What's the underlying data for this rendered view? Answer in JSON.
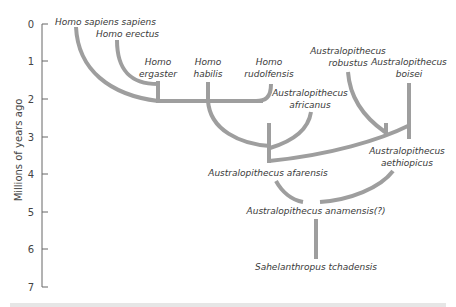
{
  "axis": {
    "title": "Millions of years ago",
    "ticks": [
      "0",
      "1",
      "2",
      "3",
      "4",
      "5",
      "6",
      "7"
    ]
  },
  "species": {
    "homo_sapiens_sapiens": "Homo sapiens sapiens",
    "homo_erectus": "Homo erectus",
    "homo_ergaster": [
      "Homo",
      "ergaster"
    ],
    "homo_habilis": [
      "Homo",
      "habilis"
    ],
    "homo_rudolfensis": [
      "Homo",
      "rudolfensis"
    ],
    "a_robustus": [
      "Australopithecus",
      "robustus"
    ],
    "a_boisei": [
      "Australopithecus",
      "boisei"
    ],
    "a_africanus": [
      "Australopithecus",
      "africanus"
    ],
    "a_afarensis": "Australopithecus afarensis",
    "a_aethiopicus": [
      "Australopithecus",
      "aethiopicus"
    ],
    "a_anamensis": "Australopithecus anamensis(?)",
    "s_tchadensis": "Sahelanthropus tchadensis"
  },
  "colors": {
    "branch": "#9e9e9e",
    "axis": "#666666",
    "text": "#3a3a3a"
  }
}
